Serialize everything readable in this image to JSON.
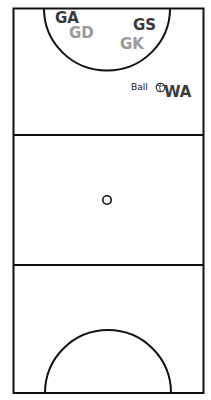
{
  "court": {
    "title": "Netball court",
    "colors": {
      "line": "#111111",
      "background": "#ffffff",
      "team_dark": "#3a3a3a",
      "team_light": "#9a9a9a"
    }
  },
  "players": [
    {
      "position": "GA",
      "shade": "dark"
    },
    {
      "position": "GD",
      "shade": "light"
    },
    {
      "position": "GS",
      "shade": "dark"
    },
    {
      "position": "GK",
      "shade": "light"
    },
    {
      "position": "WA",
      "shade": "dark"
    }
  ],
  "ball": {
    "label": "Ball",
    "icon": "ball-icon"
  },
  "markers": {
    "center_circle": "center-circle"
  }
}
